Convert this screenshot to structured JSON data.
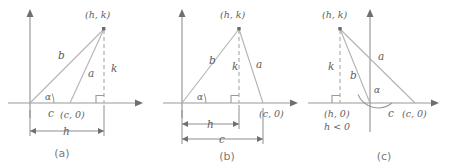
{
  "figure": {
    "title": "",
    "background_color": "#ffffff",
    "line_color": "#b3b3b3",
    "axis_color": "#9a9a9a",
    "label_color": "#5d5d5d",
    "caption_color": "#7a7a7a",
    "panels": [
      {
        "id": "a",
        "caption": "(a)",
        "description": "Obtuse-free triangle with foot of altitude to the right of (c,0); h > c > 0",
        "labels": {
          "apex_point": "(h, k)",
          "side_b": "b",
          "side_a": "a",
          "altitude_k": "k",
          "base_c_short": "c",
          "point_c": "(c, 0)",
          "angle": "α",
          "dimension_h": "h"
        }
      },
      {
        "id": "b",
        "caption": "(b)",
        "description": "Triangle with foot of altitude between origin and (c,0); 0 < h < c",
        "labels": {
          "apex_point": "(h, k)",
          "side_b": "b",
          "side_a": "a",
          "altitude_k": "k",
          "point_c": "(c, 0)",
          "angle": "α",
          "dimension_h": "h",
          "dimension_c": "c"
        }
      },
      {
        "id": "c",
        "caption": "(c)",
        "description": "Triangle with apex left of the y-axis; h < 0",
        "labels": {
          "apex_point": "(h, k)",
          "side_b": "b",
          "side_a": "a",
          "altitude_k": "k",
          "foot_point": "(h, 0)",
          "condition": "h < 0",
          "base_c_short": "c",
          "point_c": "(c, 0)",
          "angle": "α"
        }
      }
    ]
  }
}
